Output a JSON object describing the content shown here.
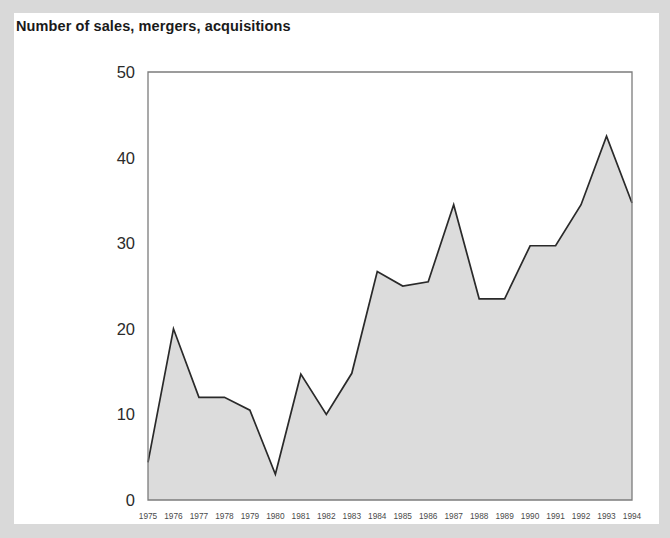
{
  "figure": {
    "title": "Number of sales, mergers, acquisitions",
    "panel_background": "#ffffff",
    "outer_background": "#d9d9d9"
  },
  "chart_data": {
    "type": "area",
    "title": "Number of sales, mergers, acquisitions",
    "xlabel": "",
    "ylabel": "",
    "categories": [
      "1975",
      "1976",
      "1977",
      "1978",
      "1979",
      "1980",
      "1981",
      "1982",
      "1983",
      "1984",
      "1985",
      "1986",
      "1987",
      "1988",
      "1989",
      "1990",
      "1991",
      "1992",
      "1993",
      "1994"
    ],
    "values": [
      4.4,
      20,
      12,
      12,
      10.5,
      3,
      14.7,
      10,
      14.8,
      26.7,
      25,
      25.5,
      34.5,
      23.5,
      23.5,
      29.7,
      29.7,
      34.5,
      42.5,
      34.7
    ],
    "ylim": [
      0,
      50
    ],
    "yticks": [
      0,
      10,
      20,
      30,
      40,
      50
    ],
    "ytick_labels": [
      "0",
      "10",
      "20",
      "30",
      "40",
      "50"
    ],
    "grid": false,
    "legend": false,
    "series_fill_color": "#dcdcdc",
    "series_line_color": "#2a2a2a",
    "axis_color": "#7c7c7c"
  }
}
